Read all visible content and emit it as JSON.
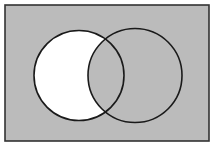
{
  "figure": {
    "canvas": {
      "width": 214,
      "height": 146,
      "background": "#ffffff"
    }
  },
  "colors": {
    "page_background": "#ffffff",
    "universe_fill": "#bbbbbb",
    "frame_stroke": "#333333",
    "circle_stroke": "#1a1a1a",
    "highlight_fill": "#ffffff",
    "intersection_fill": "#bbbbbb"
  },
  "frame": {
    "label": "universal-set-rectangle",
    "x": 5,
    "y": 5,
    "width": 204,
    "height": 136,
    "stroke_width": 1.6,
    "fill": "#bbbbbb",
    "stroke": "#333333"
  },
  "circles": [
    {
      "label": "left-circle",
      "set_name": "A",
      "cx": 79,
      "cy": 75.5,
      "r": 45,
      "stroke": "#1a1a1a",
      "stroke_width": 1.6
    },
    {
      "label": "right-circle",
      "set_name": "B",
      "cx": 135,
      "cy": 75.5,
      "r": 47,
      "stroke": "#1a1a1a",
      "stroke_width": 1.6
    }
  ],
  "shaded_region": {
    "label": "left-circle-only",
    "expression": "A minus B",
    "fill": "#ffffff",
    "description": "Region inside the left circle but outside the right circle"
  },
  "intersection": {
    "label": "lens-intersection",
    "expression": "A and B",
    "fill": "#bbbbbb",
    "top_point": {
      "x": 106.5,
      "y": 41
    },
    "bottom_point": {
      "x": 106.5,
      "y": 110
    }
  },
  "labels": {
    "left_set": "",
    "right_set": "",
    "universe": ""
  }
}
